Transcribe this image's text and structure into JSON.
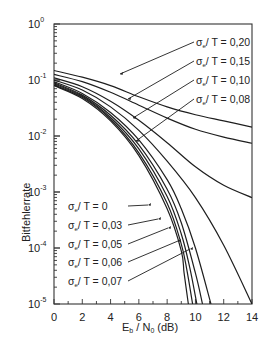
{
  "chart_data": {
    "type": "line",
    "title": "",
    "xlabel": "E_b / N_0 (dB)",
    "ylabel": "Bitfehlerrate",
    "xlim": [
      0,
      14
    ],
    "ylim": [
      1e-05,
      1
    ],
    "yscale": "log",
    "grid": false,
    "x_ticks": [
      0,
      2,
      4,
      6,
      8,
      10,
      12,
      14
    ],
    "y_ticks": [
      {
        "value": 1,
        "label_base": "10",
        "label_exp": "0"
      },
      {
        "value": 0.1,
        "label_base": "10",
        "label_exp": "-1"
      },
      {
        "value": 0.01,
        "label_base": "10",
        "label_exp": "-2"
      },
      {
        "value": 0.001,
        "label_base": "10",
        "label_exp": "-3"
      },
      {
        "value": 0.0001,
        "label_base": "10",
        "label_exp": "-4"
      },
      {
        "value": 1e-05,
        "label_base": "10",
        "label_exp": "-5"
      }
    ],
    "series": [
      {
        "name": "σe/T = 0,20",
        "label": "σₑ/ T = 0,20",
        "x": [
          0,
          2,
          4,
          6,
          8,
          10,
          12,
          14
        ],
        "log10_y": [
          -0.83,
          -0.95,
          -1.1,
          -1.3,
          -1.48,
          -1.62,
          -1.73,
          -1.84
        ]
      },
      {
        "name": "σe/T = 0,15",
        "label": "σₑ/ T = 0,15",
        "x": [
          0,
          2,
          4,
          6,
          8,
          10,
          12,
          14
        ],
        "log10_y": [
          -0.9,
          -1.03,
          -1.22,
          -1.45,
          -1.68,
          -1.88,
          -2.02,
          -2.13
        ]
      },
      {
        "name": "σe/T = 0,10",
        "label": "σₑ/ T = 0,10",
        "x": [
          0,
          2,
          4,
          6,
          8,
          10,
          12,
          14
        ],
        "log10_y": [
          -0.96,
          -1.12,
          -1.38,
          -1.72,
          -2.12,
          -2.55,
          -2.88,
          -3.1
        ]
      },
      {
        "name": "σe/T = 0,08",
        "label": "σₑ/ T = 0,08",
        "x": [
          0,
          2,
          4,
          6,
          8,
          10,
          12,
          14
        ],
        "log10_y": [
          -1.0,
          -1.18,
          -1.48,
          -1.9,
          -2.45,
          -3.1,
          -3.95,
          -5.0
        ]
      },
      {
        "name": "σe/T = 0,07",
        "label": "σₑ/ T = 0,07",
        "x": [
          0,
          2,
          4,
          6,
          8,
          9,
          10,
          11.1
        ],
        "log10_y": [
          -1.03,
          -1.24,
          -1.58,
          -2.07,
          -2.78,
          -3.3,
          -4.0,
          -5.0
        ]
      },
      {
        "name": "σe/T = 0,06",
        "label": "σₑ/ T = 0,06",
        "x": [
          0,
          2,
          4,
          6,
          8,
          9,
          10,
          10.5
        ],
        "log10_y": [
          -1.05,
          -1.27,
          -1.63,
          -2.16,
          -2.95,
          -3.55,
          -4.45,
          -5.0
        ]
      },
      {
        "name": "σe/T = 0,05",
        "label": "σₑ/ T = 0,05",
        "x": [
          0,
          2,
          4,
          6,
          8,
          9,
          9.6,
          10.1
        ],
        "log10_y": [
          -1.07,
          -1.29,
          -1.67,
          -2.23,
          -3.08,
          -3.75,
          -4.35,
          -5.0
        ]
      },
      {
        "name": "σe/T = 0,03",
        "label": "σₑ/ T = 0,03",
        "x": [
          0,
          2,
          4,
          6,
          8,
          9,
          9.4,
          9.8
        ],
        "log10_y": [
          -1.09,
          -1.31,
          -1.7,
          -2.3,
          -3.2,
          -3.93,
          -4.4,
          -5.0
        ]
      },
      {
        "name": "σe/T = 0",
        "label": "σₑ/ T = 0",
        "x": [
          0,
          2,
          4,
          6,
          8,
          9,
          9.2,
          9.5
        ],
        "log10_y": [
          -1.1,
          -1.33,
          -1.73,
          -2.35,
          -3.3,
          -4.05,
          -4.45,
          -5.0
        ]
      }
    ],
    "annotations": {
      "upper_labels": [
        "σe/T = 0,20",
        "σe/T = 0,15",
        "σe/T = 0,10",
        "σe/T = 0,08"
      ],
      "lower_labels": [
        "σe/T = 0",
        "σe/T = 0,03",
        "σe/T = 0,05",
        "σe/T = 0,06",
        "σe/T = 0,07"
      ]
    }
  },
  "labels": {
    "ylabel": "Bitfehlerrate",
    "xlabel_E": "E",
    "xlabel_b": "b",
    "xlabel_mid": " / N",
    "xlabel_0": "0",
    "xlabel_unit": " (dB)",
    "sigma": "σ",
    "sigma_sub": "e",
    "upper": [
      {
        "text": "/ T = 0,20",
        "lx": 196,
        "ly": 46,
        "px": 120,
        "py": 74
      },
      {
        "text": "/ T = 0,15",
        "lx": 196,
        "ly": 65,
        "px": 128,
        "py": 99
      },
      {
        "text": "/ T = 0,10",
        "lx": 196,
        "ly": 84,
        "px": 133,
        "py": 118
      },
      {
        "text": "/ T = 0,08",
        "lx": 196,
        "ly": 103,
        "px": 136,
        "py": 141
      }
    ],
    "lower": [
      {
        "text": "/ T = 0",
        "lx": 68,
        "ly": 210,
        "px": 148,
        "py": 205
      },
      {
        "text": "/ T = 0,03",
        "lx": 68,
        "ly": 229,
        "px": 158,
        "py": 219
      },
      {
        "text": "/ T = 0,05",
        "lx": 68,
        "ly": 248,
        "px": 168,
        "py": 228
      },
      {
        "text": "/ T = 0,06",
        "lx": 68,
        "ly": 266,
        "px": 178,
        "py": 241
      },
      {
        "text": "/ T = 0,07",
        "lx": 68,
        "ly": 285,
        "px": 190,
        "py": 249
      }
    ]
  },
  "colors": {
    "line": "#1e1e1e",
    "axis": "#333333",
    "text": "#222222",
    "background": "#ffffff"
  }
}
